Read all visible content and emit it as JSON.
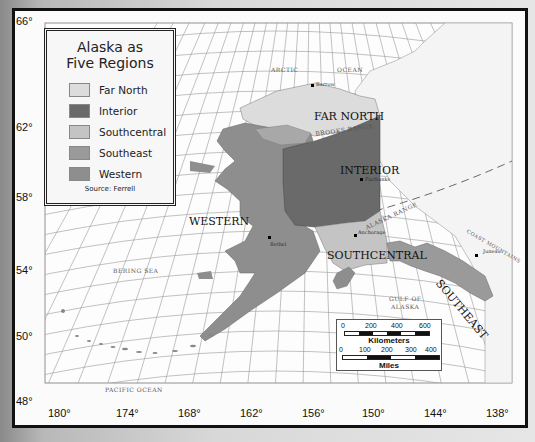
{
  "legend": {
    "title_line1": "Alaska as",
    "title_line2": "Five Regions",
    "items": [
      {
        "label": "Far North",
        "color": "#dcdcdc"
      },
      {
        "label": "Interior",
        "color": "#6a6a6a"
      },
      {
        "label": "Southcentral",
        "color": "#c4c4c4"
      },
      {
        "label": "Southeast",
        "color": "#9a9a9a"
      },
      {
        "label": "Western",
        "color": "#8e8e8e"
      }
    ],
    "source": "Source: Ferrell"
  },
  "latitudes": [
    "66°",
    "62°",
    "58°",
    "54°",
    "50°",
    "48°"
  ],
  "longitudes": [
    "180°",
    "174°",
    "168°",
    "162°",
    "156°",
    "150°",
    "144°",
    "138°"
  ],
  "regions": {
    "far_north": "FAR NORTH",
    "interior": "INTERIOR",
    "southcentral": "SOUTHCENTRAL",
    "southeast": "SOUTHEAST",
    "western": "WESTERN"
  },
  "features": {
    "brooks_range": "BROOKS   RANGE",
    "alaska_range": "ALASKA  RANGE",
    "coast_mountains": "COAST   MOUNTAINS"
  },
  "water": {
    "arctic": "ARCTIC",
    "ocean": "OCEAN",
    "bering_sea": "BERING SEA",
    "gulf_of_alaska_1": "GULF OF",
    "gulf_of_alaska_2": "ALASKA",
    "pacific_ocean": "PACIFIC OCEAN"
  },
  "cities": {
    "barrow": "Barrow",
    "fairbanks": "Fairbanks",
    "anchorage": "Anchorage",
    "bethel": "Bethel",
    "juneau": "Juneau"
  },
  "scale": {
    "km_ticks": [
      "0",
      "200",
      "400",
      "600"
    ],
    "km_label": "Kilometers",
    "mi_ticks": [
      "0",
      "100",
      "200",
      "300",
      "400"
    ],
    "mi_label": "Miles"
  }
}
